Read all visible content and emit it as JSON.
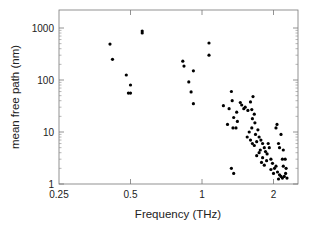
{
  "chart_data": {
    "type": "scatter",
    "title": "",
    "xlabel": "Frequency (THz)",
    "ylabel": "mean free path (nm)",
    "xscale": "log2",
    "yscale": "log10",
    "xlim": [
      0.25,
      2.35
    ],
    "ylim": [
      1,
      2000
    ],
    "x_ticks": [
      0.25,
      0.5,
      1,
      2
    ],
    "x_tick_labels": [
      "0.25",
      "0.5",
      "1",
      "2"
    ],
    "y_ticks": [
      1,
      10,
      100,
      1000
    ],
    "y_tick_labels": [
      "1",
      "10",
      "100",
      "1000"
    ],
    "grid": false,
    "legend": null,
    "marker_color": "#000000",
    "series": [
      {
        "name": "phonon modes",
        "points": [
          [
            0.41,
            490
          ],
          [
            0.42,
            250
          ],
          [
            0.48,
            125
          ],
          [
            0.5,
            80
          ],
          [
            0.49,
            56
          ],
          [
            0.5,
            56
          ],
          [
            0.56,
            870
          ],
          [
            0.56,
            800
          ],
          [
            1.07,
            515
          ],
          [
            1.07,
            300
          ],
          [
            0.83,
            230
          ],
          [
            0.84,
            185
          ],
          [
            0.92,
            150
          ],
          [
            0.88,
            92
          ],
          [
            0.9,
            59
          ],
          [
            0.92,
            35
          ],
          [
            1.23,
            32
          ],
          [
            1.33,
            60
          ],
          [
            1.34,
            40
          ],
          [
            1.3,
            28
          ],
          [
            1.36,
            19
          ],
          [
            1.4,
            24
          ],
          [
            1.41,
            16
          ],
          [
            1.39,
            12
          ],
          [
            1.35,
            12
          ],
          [
            1.28,
            14
          ],
          [
            1.33,
            2.0
          ],
          [
            1.36,
            1.6
          ],
          [
            1.45,
            37
          ],
          [
            1.47,
            33
          ],
          [
            1.5,
            28
          ],
          [
            1.52,
            30
          ],
          [
            1.56,
            26
          ],
          [
            1.6,
            38
          ],
          [
            1.62,
            27
          ],
          [
            1.64,
            48
          ],
          [
            1.66,
            22
          ],
          [
            1.63,
            18
          ],
          [
            1.67,
            15
          ],
          [
            1.62,
            12
          ],
          [
            1.58,
            10
          ],
          [
            1.55,
            8
          ],
          [
            1.6,
            7
          ],
          [
            1.63,
            6
          ],
          [
            1.66,
            5.5
          ],
          [
            1.7,
            6.5
          ],
          [
            1.68,
            9
          ],
          [
            1.72,
            11
          ],
          [
            1.74,
            8
          ],
          [
            1.77,
            7
          ],
          [
            1.8,
            6
          ],
          [
            1.83,
            5
          ],
          [
            1.76,
            4.5
          ],
          [
            1.74,
            4
          ],
          [
            1.7,
            3.5
          ],
          [
            1.8,
            3.2
          ],
          [
            1.85,
            4.2
          ],
          [
            1.88,
            3.8
          ],
          [
            1.9,
            6
          ],
          [
            1.92,
            5
          ],
          [
            1.95,
            3
          ],
          [
            1.98,
            2.5
          ],
          [
            2.02,
            2
          ],
          [
            1.87,
            2.8
          ],
          [
            2.05,
            12
          ],
          [
            2.07,
            14
          ],
          [
            2.1,
            6
          ],
          [
            2.12,
            5
          ],
          [
            2.15,
            9
          ],
          [
            2.18,
            3
          ],
          [
            2.05,
            2.2
          ],
          [
            2.08,
            1.7
          ],
          [
            2.12,
            1.5
          ],
          [
            2.15,
            1.4
          ],
          [
            2.18,
            1.3
          ],
          [
            2.22,
            1.4
          ],
          [
            2.25,
            1.6
          ],
          [
            2.2,
            2.2
          ],
          [
            2.24,
            3.0
          ],
          [
            2.26,
            2.0
          ],
          [
            2.1,
            1.25
          ],
          [
            2.0,
            1.6
          ],
          [
            1.95,
            1.9
          ],
          [
            2.2,
            4.5
          ],
          [
            1.83,
            2.3
          ],
          [
            1.78,
            2.6
          ],
          [
            2.28,
            1.3
          ]
        ]
      }
    ]
  }
}
